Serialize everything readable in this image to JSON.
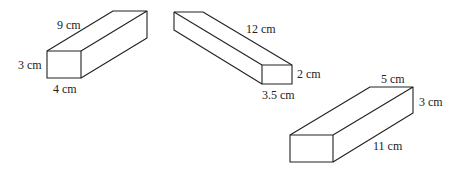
{
  "figure": {
    "prisms": [
      {
        "id": "prism-a",
        "labels": {
          "length": "9 cm",
          "height": "3 cm",
          "width": "4 cm"
        }
      },
      {
        "id": "prism-b",
        "labels": {
          "length": "12 cm",
          "height": "2 cm",
          "width": "3.5 cm"
        }
      },
      {
        "id": "prism-c",
        "labels": {
          "width": "5 cm",
          "height": "3 cm",
          "length": "11 cm"
        }
      }
    ]
  }
}
